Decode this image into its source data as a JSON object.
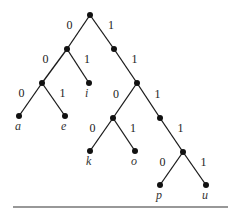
{
  "diagram": {
    "type": "binary-prefix-code-tree",
    "nodes": [
      {
        "id": "root",
        "x": 90,
        "y": 15
      },
      {
        "id": "0",
        "x": 67,
        "y": 49
      },
      {
        "id": "1",
        "x": 114,
        "y": 49
      },
      {
        "id": "00",
        "x": 42,
        "y": 83
      },
      {
        "id": "01",
        "x": 89,
        "y": 83,
        "label": "i"
      },
      {
        "id": "11",
        "x": 137,
        "y": 83
      },
      {
        "id": "000",
        "x": 19,
        "y": 116,
        "label": "a"
      },
      {
        "id": "001",
        "x": 65,
        "y": 116,
        "label": "e"
      },
      {
        "id": "110",
        "x": 113,
        "y": 118
      },
      {
        "id": "111",
        "x": 160,
        "y": 118
      },
      {
        "id": "1100",
        "x": 90,
        "y": 151,
        "label": "k"
      },
      {
        "id": "1101",
        "x": 135,
        "y": 151,
        "label": "o"
      },
      {
        "id": "1111",
        "x": 183,
        "y": 152
      },
      {
        "id": "11110",
        "x": 160,
        "y": 185,
        "label": "p"
      },
      {
        "id": "11111",
        "x": 206,
        "y": 185,
        "label": "u"
      }
    ],
    "edges": [
      {
        "from": "root",
        "to": "0",
        "bit": "0"
      },
      {
        "from": "root",
        "to": "1",
        "bit": "1"
      },
      {
        "from": "0",
        "to": "00",
        "bit": "0"
      },
      {
        "from": "0",
        "to": "01",
        "bit": "1"
      },
      {
        "from": "1",
        "to": "11",
        "bit": "1"
      },
      {
        "from": "00",
        "to": "000",
        "bit": "0"
      },
      {
        "from": "00",
        "to": "001",
        "bit": "1"
      },
      {
        "from": "11",
        "to": "110",
        "bit": "0"
      },
      {
        "from": "11",
        "to": "111",
        "bit": "1"
      },
      {
        "from": "110",
        "to": "1100",
        "bit": "0"
      },
      {
        "from": "110",
        "to": "1101",
        "bit": "1"
      },
      {
        "from": "111",
        "to": "1111",
        "bit": "1"
      },
      {
        "from": "1111",
        "to": "11110",
        "bit": "0"
      },
      {
        "from": "1111",
        "to": "11111",
        "bit": "1"
      }
    ],
    "leaves": [
      "a",
      "e",
      "i",
      "k",
      "o",
      "p",
      "u"
    ],
    "bottom_rule": {
      "x1": 13,
      "x2": 228,
      "y": 207
    }
  }
}
